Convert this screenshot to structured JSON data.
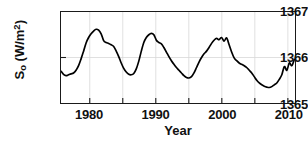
{
  "chart_data": {
    "type": "line",
    "title": "",
    "xlabel": "Year",
    "ylabel": "S_o (W/m^2)",
    "ylabel_main": "S",
    "ylabel_sub": "o",
    "ylabel_unit_open": " (W/m",
    "ylabel_sup": "2",
    "ylabel_unit_close": ")",
    "xlim": [
      1975.6,
      2012.9
    ],
    "ylim": [
      1365,
      1367
    ],
    "xticks": [
      1980,
      1990,
      2000,
      2010
    ],
    "xtick_labels": [
      "1980",
      "1990",
      "2000",
      "2010"
    ],
    "xminorticks": [
      1980,
      1985,
      1990,
      1995,
      2000,
      2005,
      2010
    ],
    "yticks": [
      1365,
      1366,
      1367
    ],
    "ytick_labels": [
      "1365",
      "1366",
      "1367"
    ],
    "grid": "light vertical gridlines at 5-year intervals and horizontal gridline at 1366",
    "legend": "none",
    "series": [
      {
        "name": "Total Solar Irradiance",
        "units": "W/m^2",
        "x": [
          1975.6,
          1976.0,
          1976.4,
          1976.8,
          1977.2,
          1977.6,
          1978.0,
          1978.4,
          1978.8,
          1979.2,
          1979.6,
          1980.0,
          1980.4,
          1980.8,
          1981.2,
          1981.6,
          1982.0,
          1982.4,
          1982.8,
          1983.2,
          1983.6,
          1984.0,
          1984.4,
          1984.8,
          1985.2,
          1985.6,
          1986.0,
          1986.4,
          1986.8,
          1987.2,
          1987.6,
          1988.0,
          1988.4,
          1988.8,
          1989.2,
          1989.6,
          1990.0,
          1990.4,
          1990.8,
          1991.2,
          1991.6,
          1992.0,
          1992.4,
          1992.8,
          1993.2,
          1993.6,
          1994.0,
          1994.4,
          1994.8,
          1995.2,
          1995.6,
          1996.0,
          1996.4,
          1996.8,
          1997.2,
          1997.6,
          1998.0,
          1998.4,
          1998.8,
          1999.2,
          1999.6,
          2000.0,
          2000.4,
          2000.8,
          2001.2,
          2001.6,
          2002.0,
          2002.4,
          2002.8,
          2003.2,
          2003.6,
          2004.0,
          2004.4,
          2004.8,
          2005.2,
          2005.6,
          2006.0,
          2006.4,
          2006.8,
          2007.2,
          2007.6,
          2008.0,
          2008.4,
          2008.8,
          2009.2,
          2009.6,
          2010.0,
          2010.4,
          2010.8,
          2011.2,
          2011.6,
          2012.0,
          2012.4,
          2012.8
        ],
        "y": [
          1365.7,
          1365.63,
          1365.6,
          1365.62,
          1365.64,
          1365.66,
          1365.72,
          1365.82,
          1365.97,
          1366.14,
          1366.32,
          1366.44,
          1366.52,
          1366.58,
          1366.62,
          1366.6,
          1366.52,
          1366.37,
          1366.33,
          1366.31,
          1366.28,
          1366.24,
          1366.14,
          1366.02,
          1365.88,
          1365.76,
          1365.68,
          1365.63,
          1365.62,
          1365.65,
          1365.75,
          1365.92,
          1366.14,
          1366.33,
          1366.44,
          1366.5,
          1366.53,
          1366.5,
          1366.38,
          1366.33,
          1366.3,
          1366.22,
          1366.12,
          1366.02,
          1365.93,
          1365.85,
          1365.78,
          1365.72,
          1365.66,
          1365.6,
          1365.56,
          1365.55,
          1365.58,
          1365.66,
          1365.78,
          1365.9,
          1366.0,
          1366.08,
          1366.14,
          1366.22,
          1366.31,
          1366.38,
          1366.42,
          1366.39,
          1366.44,
          1366.36,
          1366.43,
          1366.28,
          1366.12,
          1365.99,
          1365.93,
          1365.88,
          1365.85,
          1365.82,
          1365.78,
          1365.72,
          1365.66,
          1365.58,
          1365.5,
          1365.44,
          1365.4,
          1365.37,
          1365.35,
          1365.34,
          1365.36,
          1365.4,
          1365.44,
          1365.52,
          1365.62,
          1365.8,
          1365.72,
          1365.88,
          1365.82,
          1365.96
        ]
      }
    ],
    "annotations": []
  }
}
